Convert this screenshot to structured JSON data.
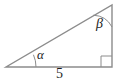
{
  "figure": {
    "name": "right-triangle-with-labeled-angles",
    "background_color": "#ffffff",
    "stroke_color": "#8c8c8c",
    "text_color": "#1d1d1d",
    "stroke_width": 1.4
  },
  "labels": {
    "alpha": "α",
    "beta": "β",
    "base_length": "5"
  },
  "geometry": {
    "vertices": {
      "left": {
        "x": 6,
        "y": 67
      },
      "bottom_right": {
        "x": 112,
        "y": 67
      },
      "top_right": {
        "x": 112,
        "y": 5
      }
    },
    "sides": {
      "base": {
        "from": "left",
        "to": "bottom_right",
        "label": "5"
      },
      "vertical": {
        "from": "bottom_right",
        "to": "top_right",
        "label": ""
      },
      "hypotenuse": {
        "from": "left",
        "to": "top_right",
        "label": ""
      }
    },
    "angle_markers": {
      "alpha_arc_radius": 30,
      "beta_arc_radius": 22,
      "right_angle_square_size": 11
    }
  }
}
